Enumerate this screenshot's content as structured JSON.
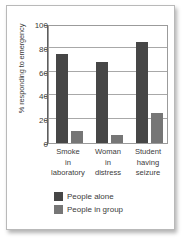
{
  "chart_data": {
    "type": "bar",
    "title": "",
    "xlabel": "",
    "ylabel": "% responding to emergency",
    "ylim": [
      0,
      100
    ],
    "yticks": [
      0,
      20,
      40,
      60,
      80,
      100
    ],
    "gridlines": [
      20,
      40,
      60,
      80
    ],
    "grid": true,
    "legend_position": "bottom",
    "categories": [
      "Smoke in laboratory",
      "Woman in distress",
      "Student having seizure"
    ],
    "category_lines": [
      [
        "Smoke",
        "in",
        "laboratory"
      ],
      [
        "Woman",
        "in",
        "distress"
      ],
      [
        "Student",
        "having",
        "seizure"
      ]
    ],
    "series": [
      {
        "name": "People alone",
        "color": "#464646",
        "values": [
          75,
          68,
          85
        ]
      },
      {
        "name": "People in group",
        "color": "#767676",
        "values": [
          10,
          7,
          25
        ]
      }
    ]
  },
  "axis": {
    "y_title": "% responding to emergency",
    "tick_labels": [
      "100",
      "80",
      "60",
      "40",
      "20",
      "0"
    ]
  },
  "legend": {
    "items": [
      {
        "label": "People alone"
      },
      {
        "label": "People in group"
      }
    ]
  },
  "colors": {
    "series_alone": "#464646",
    "series_group": "#767676",
    "grid": "#a8a8a8",
    "axis": "#5e5e5e",
    "text": "#3b3b3b",
    "card_border": "#b9b9b9",
    "background": "#ffffff"
  }
}
